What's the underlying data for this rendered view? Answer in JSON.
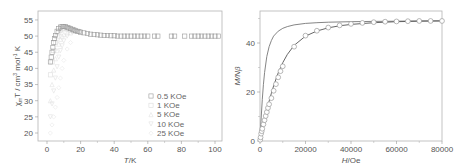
{
  "chart_data": [
    {
      "type": "scatter",
      "title": "",
      "xlabel": "T/K",
      "ylabel": "χm T / cm3 mol-1 K",
      "xlim": [
        -5,
        104
      ],
      "ylim": [
        17.5,
        57.8
      ],
      "xticks": [
        0,
        20,
        40,
        60,
        80,
        100
      ],
      "yticks": [
        20,
        25,
        30,
        35,
        40,
        45,
        50,
        55
      ],
      "grid": false,
      "legend_position": "lower right",
      "legend": [
        "0.5 KOe",
        "1 KOe",
        "5 KOe",
        "10 KOe",
        "25 KOe"
      ],
      "series": [
        {
          "name": "0.5 KOe",
          "marker": "square",
          "color": "#9a9a9a",
          "x": [
            2,
            2.5,
            3,
            3.5,
            4,
            4.5,
            5,
            6,
            7,
            8,
            9,
            10,
            11,
            12,
            13,
            14,
            15,
            16,
            17,
            18,
            19,
            20,
            22,
            24,
            26,
            28,
            30,
            32,
            34,
            36,
            38,
            40,
            42,
            44,
            46,
            48,
            50,
            52,
            54,
            56,
            58,
            60,
            64,
            66,
            74,
            76,
            82,
            86,
            88,
            90,
            92,
            94,
            96,
            98,
            100,
            102
          ],
          "y": [
            42.0,
            43.5,
            45.0,
            46.5,
            48.0,
            49.2,
            50.2,
            51.5,
            52.3,
            52.8,
            53.0,
            53.0,
            52.9,
            52.7,
            52.5,
            52.3,
            52.1,
            51.9,
            51.7,
            51.5,
            51.4,
            51.2,
            51.0,
            50.8,
            50.6,
            50.5,
            50.4,
            50.3,
            50.2,
            50.2,
            50.1,
            50.1,
            50.0,
            50.0,
            50.0,
            50.0,
            50.0,
            50.0,
            50.0,
            50.0,
            50.0,
            50.0,
            50.0,
            50.0,
            50.0,
            50.0,
            50.0,
            50.0,
            50.0,
            50.0,
            50.0,
            50.0,
            50.0,
            50.0,
            50.0,
            50.0
          ]
        },
        {
          "name": "1 KOe",
          "marker": "square",
          "color": "#dcdcdc",
          "x": [
            2,
            3,
            4,
            5,
            6,
            7,
            8,
            9,
            10,
            12,
            14,
            16
          ],
          "y": [
            38.0,
            42.0,
            45.5,
            48.0,
            49.8,
            51.0,
            51.8,
            52.2,
            52.4,
            52.2,
            51.8,
            51.5
          ]
        },
        {
          "name": "5 KOe",
          "marker": "triangle",
          "color": "#e2e2e2",
          "x": [
            2,
            3,
            4,
            5,
            6,
            7,
            8,
            9,
            10,
            12,
            14
          ],
          "y": [
            30.0,
            35.0,
            39.5,
            43.0,
            45.5,
            47.5,
            49.0,
            50.0,
            50.5,
            51.0,
            51.0
          ]
        },
        {
          "name": "10 KOe",
          "marker": "triangle-down",
          "color": "#e0e0e0",
          "x": [
            2,
            3,
            4,
            5,
            6,
            7,
            8,
            9,
            10,
            12
          ],
          "y": [
            25.0,
            29.0,
            33.0,
            37.0,
            40.5,
            43.5,
            45.5,
            47.0,
            48.5,
            50.0
          ]
        },
        {
          "name": "25 KOe",
          "marker": "diamond",
          "color": "#e8e8e8",
          "x": [
            2,
            3,
            4,
            5,
            6,
            7,
            8,
            9,
            10,
            12,
            14
          ],
          "y": [
            20.0,
            22.5,
            25.0,
            28.0,
            31.0,
            34.0,
            37.0,
            40.0,
            42.5,
            46.0,
            48.0
          ]
        }
      ]
    },
    {
      "type": "scatter",
      "title": "",
      "xlabel": "H/Oe",
      "ylabel": "M/Nβ",
      "xlim": [
        0,
        80000
      ],
      "ylim": [
        0,
        53
      ],
      "xticks": [
        0,
        20000,
        40000,
        60000,
        80000
      ],
      "yticks": [
        0,
        20,
        40
      ],
      "grid": false,
      "series": [
        {
          "name": "experimental",
          "marker": "circle",
          "color": "#999999",
          "x": [
            100,
            250,
            500,
            750,
            1000,
            1500,
            2000,
            2500,
            3000,
            3500,
            4000,
            5000,
            6000,
            7000,
            8000,
            9000,
            10000,
            15000,
            20000,
            25000,
            30000,
            35000,
            40000,
            45000,
            50000,
            55000,
            60000,
            65000,
            70000,
            75000,
            80000
          ],
          "y": [
            0.5,
            1.5,
            3.0,
            4.0,
            5.0,
            6.8,
            8.5,
            10.2,
            11.8,
            13.5,
            15.0,
            17.5,
            20.5,
            23.2,
            26.0,
            28.5,
            30.5,
            38.5,
            43.0,
            45.0,
            46.3,
            47.2,
            47.8,
            48.2,
            48.5,
            48.7,
            48.8,
            48.9,
            49.0,
            49.0,
            49.0
          ]
        },
        {
          "name": "fit-1",
          "marker": "line",
          "color": "#777777",
          "x": [
            0,
            500,
            1000,
            1500,
            2000,
            3000,
            4000,
            5000,
            6000,
            8000,
            10000,
            12000,
            15000,
            20000,
            25000,
            30000,
            40000,
            50000,
            60000,
            70000,
            80000
          ],
          "y": [
            0,
            9.0,
            17.0,
            23.0,
            28.0,
            34.5,
            38.5,
            41.0,
            42.8,
            44.8,
            46.0,
            46.7,
            47.4,
            48.0,
            48.3,
            48.5,
            48.7,
            48.8,
            48.9,
            49.0,
            49.0
          ]
        },
        {
          "name": "fit-2",
          "marker": "line",
          "color": "#555555",
          "x": [
            0,
            500,
            1000,
            2000,
            3000,
            4000,
            5000,
            6000,
            8000,
            10000,
            12000,
            15000,
            20000,
            25000,
            30000,
            35000,
            40000,
            50000,
            60000,
            70000,
            80000
          ],
          "y": [
            0,
            2.2,
            4.5,
            8.8,
            12.6,
            16.2,
            19.5,
            22.5,
            27.8,
            32.0,
            35.3,
            39.0,
            42.8,
            44.9,
            46.2,
            47.0,
            47.6,
            48.3,
            48.7,
            48.9,
            49.0
          ]
        }
      ]
    }
  ],
  "left_chart": {
    "ylabel_main": "χ",
    "ylabel_sub": "m",
    "ylabel_rest": "T / cm",
    "ylabel_sup1": "3",
    "ylabel_mid": " mol",
    "ylabel_sup2": "-1",
    "ylabel_end": " K",
    "xlabel_italic": "T",
    "xlabel_rest": "/K",
    "xtick_labels": [
      "0",
      "20",
      "40",
      "60",
      "80",
      "100"
    ],
    "ytick_labels": [
      "20",
      "25",
      "30",
      "35",
      "40",
      "45",
      "50",
      "55"
    ],
    "legend": [
      "0.5 KOe",
      "1 KOe",
      "5 KOe",
      "10 KOe",
      "25 KOe"
    ]
  },
  "right_chart": {
    "ylabel": "M/Nβ",
    "xlabel_italic": "H",
    "xlabel_rest": "/Oe",
    "xtick_labels": [
      "0",
      "20000",
      "40000",
      "60000",
      "80000"
    ],
    "ytick_labels": [
      "0",
      "20",
      "40"
    ]
  }
}
